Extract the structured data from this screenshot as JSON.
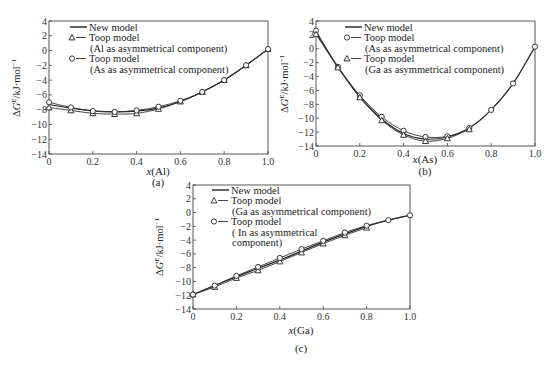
{
  "figure": {
    "panels": [
      {
        "id": "a",
        "label": "(a)",
        "xlabel_var": "x",
        "xlabel_el": "(Al)"
      },
      {
        "id": "b",
        "label": "(b)",
        "xlabel_var": "x",
        "xlabel_el": "(As)"
      },
      {
        "id": "c",
        "label": "(c)",
        "xlabel_var": "x",
        "xlabel_el": "(Ga)"
      }
    ],
    "ylabel": "ΔG^E/kJ·mol^-1"
  },
  "chart_data": [
    {
      "type": "line",
      "panel": "(a)",
      "title": "",
      "xlabel": "x(Al)",
      "ylabel": "ΔG^E/kJ·mol^-1",
      "xlim": [
        0,
        1.0
      ],
      "ylim": [
        -14,
        4
      ],
      "xticks": [
        0,
        0.2,
        0.4,
        0.6,
        0.8,
        1.0
      ],
      "xtick_labels": [
        "0",
        "0.2",
        "0.4",
        "0.6",
        "0.8",
        "1.0"
      ],
      "yticks": [
        4,
        2,
        0,
        -2,
        -4,
        -6,
        -8,
        -10,
        -12,
        -14
      ],
      "ytick_labels": [
        "4",
        "2",
        "0",
        "−2",
        "−4",
        "−6",
        "−8",
        "−10",
        "−12",
        "−14"
      ],
      "grid": false,
      "legend_position": "upper left",
      "legend": [
        {
          "marker": "line",
          "text": [
            "New model"
          ]
        },
        {
          "marker": "triangle",
          "text": [
            "Toop model",
            "(Al as asymmetrical component)"
          ]
        },
        {
          "marker": "circle",
          "text": [
            "Toop model",
            "(As as asymmetrical component)"
          ]
        }
      ],
      "x": [
        0,
        0.1,
        0.2,
        0.3,
        0.4,
        0.5,
        0.6,
        0.7,
        0.8,
        0.9,
        1.0
      ],
      "series": [
        {
          "name": "New model",
          "marker": "none",
          "values": [
            -7.3,
            -7.8,
            -8.15,
            -8.3,
            -8.2,
            -7.8,
            -6.9,
            -5.6,
            -4.0,
            -2.0,
            0.2
          ]
        },
        {
          "name": "Toop model (Al as asymmetrical component)",
          "marker": "triangle",
          "values": [
            -7.7,
            -8.1,
            -8.5,
            -8.6,
            -8.5,
            -7.9,
            -6.9,
            -5.6,
            -4.0,
            -2.0,
            0.2
          ]
        },
        {
          "name": "Toop model (As as asymmetrical component)",
          "marker": "circle",
          "values": [
            -7.0,
            -7.7,
            -8.2,
            -8.3,
            -8.1,
            -7.6,
            -6.8,
            -5.6,
            -4.0,
            -2.0,
            0.2
          ]
        }
      ]
    },
    {
      "type": "line",
      "panel": "(b)",
      "title": "",
      "xlabel": "x(As)",
      "ylabel": "ΔG^E/kJ·mol^-1",
      "xlim": [
        0,
        1.0
      ],
      "ylim": [
        -14,
        4
      ],
      "xticks": [
        0,
        0.2,
        0.4,
        0.6,
        0.8,
        1.0
      ],
      "xtick_labels": [
        "0",
        "0.2",
        "0.4",
        "0.6",
        "0.8",
        "1.0"
      ],
      "yticks": [
        4,
        2,
        0,
        -2,
        -4,
        -6,
        -8,
        -10,
        -12,
        -14
      ],
      "ytick_labels": [
        "4",
        "2",
        "0",
        "−2",
        "−4",
        "−6",
        "−8",
        "−10",
        "−12",
        "−14"
      ],
      "grid": false,
      "legend_position": "upper right",
      "legend": [
        {
          "marker": "line",
          "text": [
            "New model"
          ]
        },
        {
          "marker": "circle",
          "text": [
            "Toop model",
            "(As as asymmetrical component)"
          ]
        },
        {
          "marker": "triangle",
          "text": [
            "Toop model",
            "(Ga as asymmetrical component)"
          ]
        }
      ],
      "x": [
        0,
        0.1,
        0.2,
        0.3,
        0.4,
        0.5,
        0.6,
        0.7,
        0.8,
        0.9,
        1.0
      ],
      "series": [
        {
          "name": "New model",
          "marker": "none",
          "values": [
            2.3,
            -2.6,
            -6.9,
            -10.1,
            -12.2,
            -13.0,
            -12.7,
            -11.4,
            -8.8,
            -5.0,
            0.3
          ]
        },
        {
          "name": "Toop model (As as asymmetrical component)",
          "marker": "circle",
          "x": [
            0,
            0.1,
            0.2,
            0.3,
            0.4,
            0.5,
            0.6,
            0.7,
            0.8,
            0.9,
            1.0
          ],
          "values": [
            2.6,
            -2.6,
            -6.7,
            -9.8,
            -11.8,
            -12.7,
            -12.6,
            -11.4,
            -8.8,
            -5.0,
            0.3
          ]
        },
        {
          "name": "Toop model (Ga as asymmetrical component)",
          "marker": "triangle",
          "x": [
            0,
            0.1,
            0.2,
            0.3,
            0.4,
            0.5,
            0.6,
            0.7
          ],
          "values": [
            2.1,
            -2.7,
            -7.0,
            -10.3,
            -12.4,
            -13.3,
            -12.9,
            -11.6
          ]
        }
      ]
    },
    {
      "type": "line",
      "panel": "(c)",
      "title": "",
      "xlabel": "x(Ga)",
      "ylabel": "ΔG^E/kJ·mol^-1",
      "xlim": [
        0,
        1.0
      ],
      "ylim": [
        -14,
        4
      ],
      "xticks": [
        0,
        0.2,
        0.4,
        0.6,
        0.8,
        1.0
      ],
      "xtick_labels": [
        "0",
        "0.2",
        "0.4",
        "0.6",
        "0.8",
        "1.0"
      ],
      "yticks": [
        4,
        2,
        0,
        -2,
        -4,
        -6,
        -8,
        -10,
        -12,
        -14
      ],
      "ytick_labels": [
        "4",
        "2",
        "0",
        "−2",
        "−4",
        "−6",
        "−8",
        "−10",
        "−12",
        "−14"
      ],
      "grid": false,
      "legend_position": "upper left",
      "legend": [
        {
          "marker": "line",
          "text": [
            "New model"
          ]
        },
        {
          "marker": "triangle",
          "text": [
            "Toop model",
            "(Ga as asymmetrical component)"
          ]
        },
        {
          "marker": "circle",
          "text": [
            "Toop model",
            "( In as asymmetrical",
            "component)"
          ]
        }
      ],
      "x": [
        0,
        0.1,
        0.2,
        0.3,
        0.4,
        0.5,
        0.6,
        0.7,
        0.8,
        0.9,
        1.0
      ],
      "series": [
        {
          "name": "New model",
          "marker": "none",
          "values": [
            -11.9,
            -10.6,
            -9.3,
            -8.1,
            -6.9,
            -5.6,
            -4.3,
            -3.1,
            -2.0,
            -1.1,
            -0.4
          ]
        },
        {
          "name": "Toop model (Ga as asymmetrical component)",
          "marker": "triangle",
          "x": [
            0,
            0.1,
            0.2,
            0.3,
            0.4,
            0.5,
            0.6,
            0.7,
            0.8
          ],
          "values": [
            -11.9,
            -10.8,
            -9.5,
            -8.4,
            -7.1,
            -5.8,
            -4.5,
            -3.3,
            -2.2
          ]
        },
        {
          "name": "Toop model (In as asymmetrical component)",
          "marker": "circle",
          "values": [
            -11.9,
            -10.6,
            -9.2,
            -7.9,
            -6.6,
            -5.3,
            -4.1,
            -2.9,
            -1.9,
            -1.1,
            -0.4
          ]
        }
      ]
    }
  ]
}
